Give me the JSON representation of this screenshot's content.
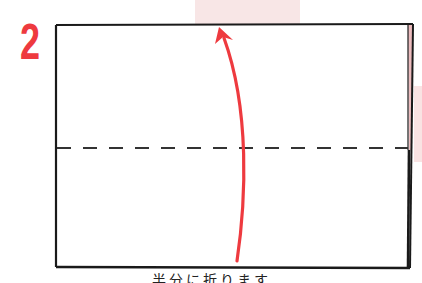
{
  "step": {
    "number": "2"
  },
  "diagram": {
    "paper": {
      "x": 56,
      "y": 24,
      "width": 354,
      "height": 244,
      "stroke": "#1a1a1a"
    },
    "fold_line": {
      "y": 148,
      "style": "dashed",
      "stroke": "#333333"
    },
    "arrow": {
      "direction": "up",
      "color": "#ee3a3f",
      "meaning": "fold bottom half up along dashed line"
    },
    "right_edge_layer_color": "#e8b5b8"
  },
  "caption": {
    "text": "半分に折ります"
  },
  "colors": {
    "accent": "#ee3a3f",
    "tint": "#f8e6e6"
  }
}
